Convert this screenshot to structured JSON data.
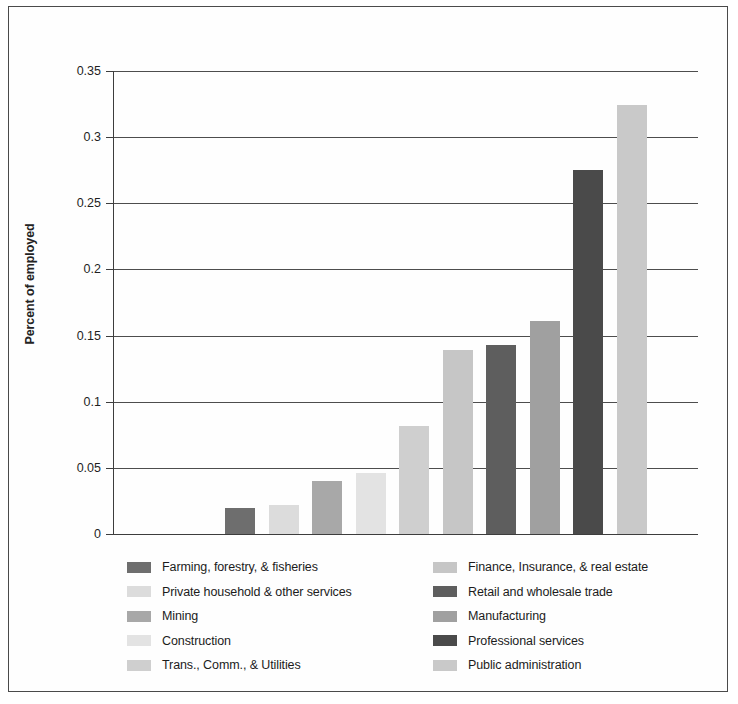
{
  "chart_data": {
    "type": "bar",
    "title": "",
    "xlabel": "",
    "ylabel": "Percent of employed",
    "ylim": [
      0,
      0.35
    ],
    "ytick_values": [
      0,
      0.05,
      0.1,
      0.15,
      0.2,
      0.25,
      0.3,
      0.35
    ],
    "ytick_labels": [
      "0",
      "0.05",
      "0.1",
      "0.15",
      "0.2",
      "0.25",
      "0.3",
      "0.35"
    ],
    "grid": "horizontal",
    "legend_position": "below-plot-two-columns",
    "categories": [
      "Farming, forestry, & fisheries",
      "Private household & other services",
      "Mining",
      "Construction",
      "Trans., Comm., & Utilities",
      "Finance, Insurance, & real estate",
      "Retail and wholesale trade",
      "Manufacturing",
      "Professional services",
      "Public administration"
    ],
    "values": [
      0.02,
      0.022,
      0.04,
      0.046,
      0.082,
      0.139,
      0.143,
      0.161,
      0.275,
      0.324
    ],
    "colors": [
      "#6e6e6e",
      "#dcdcdc",
      "#a8a8a8",
      "#e3e3e3",
      "#cfcfcf",
      "#c6c6c6",
      "#5e5e5e",
      "#a0a0a0",
      "#4a4a4a",
      "#c9c9c9"
    ]
  },
  "legend": {
    "left_column": [
      {
        "label": "Farming, forestry, & fisheries",
        "color": "#6e6e6e"
      },
      {
        "label": "Private household & other services",
        "color": "#dcdcdc"
      },
      {
        "label": "Mining",
        "color": "#a8a8a8"
      },
      {
        "label": "Construction",
        "color": "#e3e3e3"
      },
      {
        "label": "Trans., Comm., & Utilities",
        "color": "#cfcfcf"
      }
    ],
    "right_column": [
      {
        "label": "Finance, Insurance, & real estate",
        "color": "#c6c6c6"
      },
      {
        "label": "Retail and wholesale trade",
        "color": "#5e5e5e"
      },
      {
        "label": "Manufacturing",
        "color": "#a0a0a0"
      },
      {
        "label": "Professional services",
        "color": "#4a4a4a"
      },
      {
        "label": "Public administration",
        "color": "#c9c9c9"
      }
    ]
  },
  "style": {
    "border_color": "#4a4a4a",
    "axis_color": "#3d3d3d",
    "gridline_color": "#4d4d4d",
    "background": "#ffffff"
  }
}
